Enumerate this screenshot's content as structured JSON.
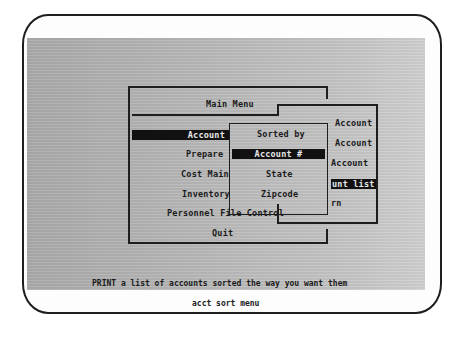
{
  "main_menu": {
    "title": "Main Menu",
    "items": [
      {
        "label": "Account",
        "selected": true
      },
      {
        "label": "Prepare",
        "selected": false
      },
      {
        "label": "Cost Main",
        "selected": false
      },
      {
        "label": "Inventory",
        "selected": false
      },
      {
        "label": "Personnel File Control",
        "selected": false
      },
      {
        "label": "Quit",
        "selected": false
      }
    ]
  },
  "account_submenu": {
    "items": [
      {
        "label": "Account",
        "selected": false
      },
      {
        "label": "Account",
        "selected": false
      },
      {
        "label": "Account",
        "selected": false
      },
      {
        "label": "unt list",
        "selected": true
      },
      {
        "label": "rn",
        "selected": false
      }
    ]
  },
  "sort_menu": {
    "title": "Sorted by",
    "items": [
      {
        "label": "Account #",
        "selected": true
      },
      {
        "label": "State",
        "selected": false
      },
      {
        "label": "Zipcode",
        "selected": false
      }
    ]
  },
  "status_line": "PRINT a list of accounts sorted the way you want them",
  "caption": "acct sort menu",
  "colors": {
    "screen_bg": "#b8b8b8",
    "text": "#1b1b1b",
    "highlight_bg": "#111111",
    "highlight_text": "#e8e8e8"
  }
}
